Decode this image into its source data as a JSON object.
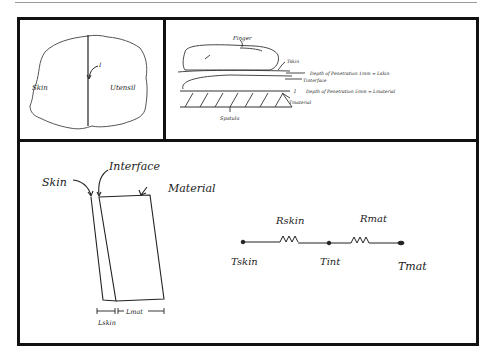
{
  "panels": {
    "top_left": {
      "title": "Skin-utensil contact region",
      "labels": {
        "skin": "Skin",
        "utensil": "Utensil",
        "interface": "I"
      }
    },
    "top_right": {
      "title": "Finger pressing on spatula cross-section",
      "labels": {
        "finger": "Finger",
        "t_skin": "Tskin",
        "depth_skin": "Depth of Penetration 1mm = Lskin",
        "t_interface": "Tinterface",
        "depth_material": "Depth of Penetration 5mm = Lmaterial",
        "t_material": "Tmaterial",
        "spatula": "Spatula",
        "marker": "I"
      }
    },
    "bottom": {
      "title": "Layered slab and thermal resistance network",
      "slab_labels": {
        "skin": "Skin",
        "interface": "Interface",
        "material": "Material",
        "l_skin": "Lskin",
        "l_mat": "Lmat"
      },
      "circuit": {
        "nodes": [
          "Tskin",
          "Tint",
          "Tmat"
        ],
        "resistors": [
          "Rskin",
          "Rmat"
        ]
      }
    }
  }
}
